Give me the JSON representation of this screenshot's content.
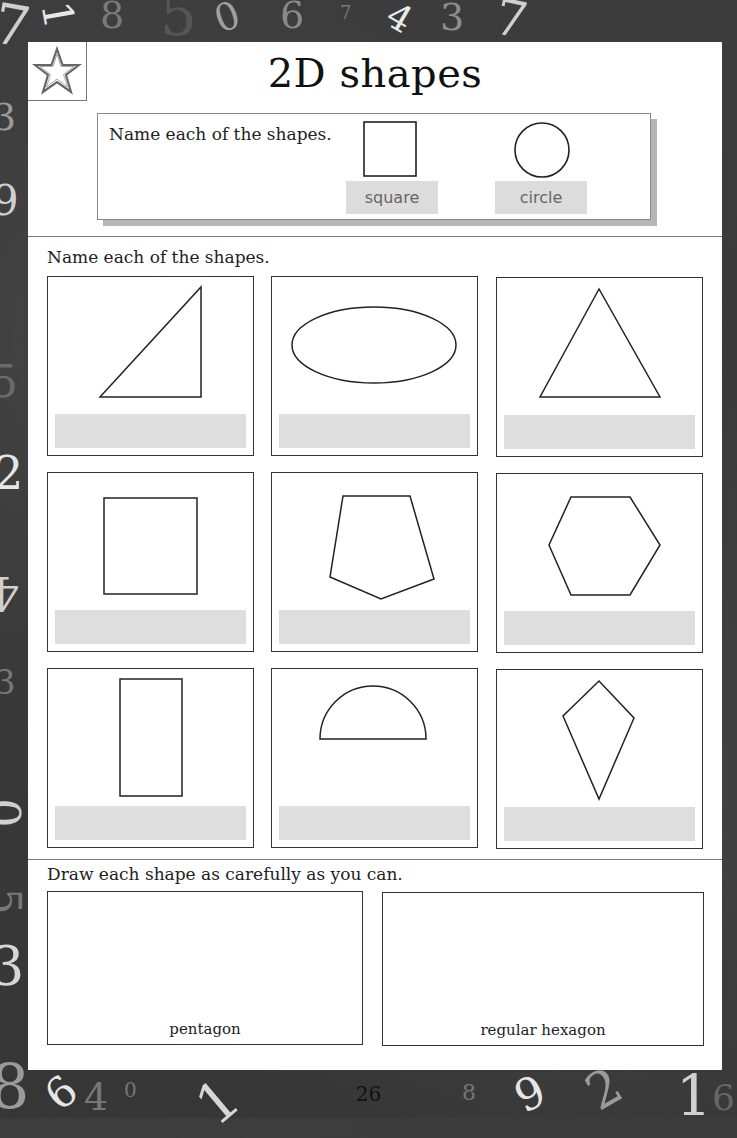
{
  "page": {
    "title": "2D shapes",
    "page_number": "26",
    "badge_icon": "star-icon"
  },
  "example": {
    "instruction": "Name each of the shapes.",
    "items": [
      {
        "shape": "square",
        "label": "square"
      },
      {
        "shape": "circle",
        "label": "circle"
      }
    ]
  },
  "name_section": {
    "instruction": "Name each of the shapes.",
    "shapes": [
      {
        "shape": "right-triangle",
        "answer": ""
      },
      {
        "shape": "ellipse",
        "answer": ""
      },
      {
        "shape": "equilateral-triangle",
        "answer": ""
      },
      {
        "shape": "square",
        "answer": ""
      },
      {
        "shape": "pentagon",
        "answer": ""
      },
      {
        "shape": "hexagon",
        "answer": ""
      },
      {
        "shape": "rectangle",
        "answer": ""
      },
      {
        "shape": "semicircle",
        "answer": ""
      },
      {
        "shape": "kite",
        "answer": ""
      }
    ]
  },
  "draw_section": {
    "instruction": "Draw each shape as carefully as you can.",
    "boxes": [
      {
        "label": "pentagon"
      },
      {
        "label": "regular hexagon"
      }
    ]
  },
  "background": {
    "color": "#3a3a3a",
    "numbers": [
      "7",
      "1",
      "8",
      "5",
      "0",
      "6",
      "7",
      "4",
      "3",
      "7",
      "3",
      "9",
      "5",
      "2",
      "4",
      "3",
      "0",
      "5",
      "3",
      "8",
      "6",
      "4",
      "0",
      "1",
      "8",
      "9",
      "2",
      "1",
      "6"
    ]
  }
}
